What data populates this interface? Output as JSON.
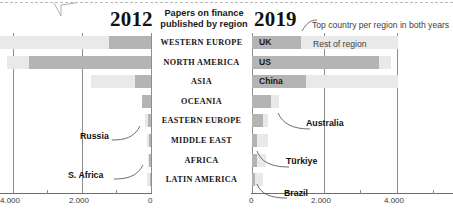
{
  "header": {
    "year_left": "2012",
    "year_right": "2019",
    "center_title_line1": "Papers on finance",
    "center_title_line2": "published by region",
    "top_note": "Top country per region in both years",
    "rest_of_region_label": "Rest of region"
  },
  "legend": {
    "top_country_color": "#b4b4b4",
    "rest_of_region_color": "#e9e9e9"
  },
  "axis": {
    "left_ticks": [
      "4.000",
      "2.000",
      "0"
    ],
    "right_ticks": [
      "0",
      "2.000",
      "4.000"
    ],
    "left_tick_values": [
      4000,
      2000,
      0
    ],
    "right_tick_values": [
      0,
      2000,
      4000
    ],
    "max": 4000
  },
  "regions": [
    "WESTERN EUROPE",
    "NORTH AMERICA",
    "ASIA",
    "OCEANIA",
    "EASTERN EUROPE",
    "MIDDLE EAST",
    "AFRICA",
    "LATIN AMERICA"
  ],
  "annotations": {
    "left": [
      {
        "label": "Russia",
        "region": "EASTERN EUROPE"
      },
      {
        "label": "S. Africa",
        "region": "AFRICA"
      }
    ],
    "right": [
      {
        "label": "Australia",
        "region": "OCEANIA"
      },
      {
        "label": "Türkiye",
        "region": "MIDDLE EAST"
      },
      {
        "label": "Brazil",
        "region": "LATIN AMERICA"
      }
    ]
  },
  "chart_data": {
    "type": "bar",
    "title": "Papers on finance published by region",
    "subtitle": "Top country per region in both years",
    "orientation": "horizontal-diverging",
    "xlabel": "",
    "ylabel": "",
    "xlim": [
      0,
      4000
    ],
    "grid": true,
    "legend": [
      "Top country per region",
      "Rest of region"
    ],
    "legend_position": "inline-top-right",
    "categories": [
      "WESTERN EUROPE",
      "NORTH AMERICA",
      "ASIA",
      "OCEANIA",
      "EASTERN EUROPE",
      "MIDDLE EAST",
      "AFRICA",
      "LATIN AMERICA"
    ],
    "panels": [
      {
        "name": "2012",
        "direction": "left",
        "series": [
          {
            "name": "Top country",
            "values": [
              1100,
              3240,
              430,
              230,
              90,
              55,
              60,
              35
            ],
            "countries": [
              "UK",
              "US",
              "China",
              "Australia",
              "Russia",
              "Türkiye",
              "S. Africa",
              "Brazil"
            ]
          },
          {
            "name": "Rest of region",
            "values": [
              2900,
              580,
              1160,
              0,
              70,
              45,
              30,
              60
            ]
          }
        ],
        "totals": [
          4000,
          3820,
          1590,
          230,
          160,
          100,
          90,
          95
        ]
      },
      {
        "name": "2019",
        "direction": "right",
        "series": [
          {
            "name": "Top country",
            "values": [
              1330,
              3480,
              1480,
              510,
              310,
              130,
              130,
              80
            ],
            "countries": [
              "UK",
              "US",
              "China",
              "Australia",
              "Russia",
              "Türkiye",
              "S. Africa",
              "Brazil"
            ]
          },
          {
            "name": "Rest of region",
            "values": [
              2670,
              320,
              2520,
              220,
              140,
              310,
              250,
              220
            ]
          }
        ],
        "totals": [
          4000,
          3800,
          4000,
          730,
          450,
          440,
          380,
          300
        ]
      }
    ]
  }
}
